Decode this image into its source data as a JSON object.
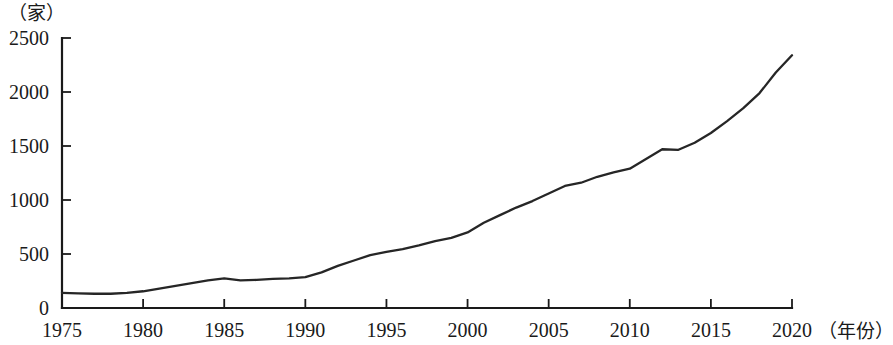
{
  "chart_data": {
    "type": "line",
    "title": "",
    "subtitle": "",
    "xlabel": "（年份）",
    "ylabel": "（家）",
    "xlim": [
      1975,
      2020
    ],
    "ylim": [
      0,
      2500
    ],
    "grid": false,
    "legend": "none",
    "x_ticks": [
      "1975",
      "1980",
      "1985",
      "1990",
      "1995",
      "2000",
      "2005",
      "2010",
      "2015",
      "2020"
    ],
    "x_tick_values": [
      1975,
      1980,
      1985,
      1990,
      1995,
      2000,
      2005,
      2010,
      2015,
      2020
    ],
    "y_ticks": [
      "0",
      "500",
      "1000",
      "1500",
      "2000",
      "2500"
    ],
    "y_tick_values": [
      0,
      500,
      1000,
      1500,
      2000,
      2500
    ],
    "series": [
      {
        "name": "数量",
        "color": "#262626",
        "x": [
          1975,
          1976,
          1977,
          1978,
          1979,
          1980,
          1981,
          1982,
          1983,
          1984,
          1985,
          1986,
          1987,
          1988,
          1989,
          1990,
          1991,
          1992,
          1993,
          1994,
          1995,
          1996,
          1997,
          1998,
          1999,
          2000,
          2001,
          2002,
          2003,
          2004,
          2005,
          2006,
          2007,
          2008,
          2009,
          2010,
          2011,
          2012,
          2013,
          2014,
          2015,
          2016,
          2017,
          2018,
          2019,
          2020
        ],
        "values": [
          140,
          135,
          132,
          132,
          140,
          155,
          180,
          205,
          230,
          255,
          275,
          255,
          260,
          270,
          275,
          285,
          330,
          390,
          440,
          490,
          520,
          545,
          580,
          620,
          650,
          700,
          790,
          860,
          930,
          990,
          1060,
          1130,
          1160,
          1215,
          1255,
          1290,
          1380,
          1470,
          1465,
          1530,
          1620,
          1730,
          1850,
          1990,
          2180,
          2340
        ]
      }
    ]
  }
}
